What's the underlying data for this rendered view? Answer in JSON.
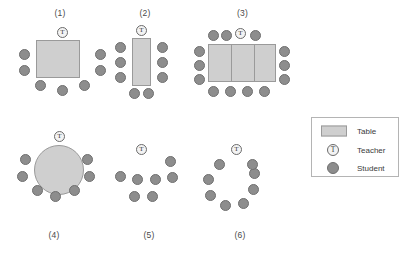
{
  "diagram": {
    "background_color": "#ffffff",
    "colors": {
      "table_fill": "#cfcfcf",
      "table_stroke": "#9a9a9a",
      "student_fill": "#8d8d8d",
      "student_stroke": "#6f6f6f",
      "teacher_fill": "#f3f3f3",
      "teacher_stroke": "#6b6b6b",
      "label_text": "#3a3a3a",
      "legend_border": "#b4b4b4"
    },
    "teacher_glyph": "T"
  },
  "arrangements": [
    {
      "id": "arrangement-1",
      "label": "(1)",
      "label_position": "top",
      "table": {
        "shape": "square",
        "count": 1,
        "segments": 1
      },
      "teacher_count": 1,
      "student_count": 7,
      "teacher": {
        "x": 47,
        "y": 5
      },
      "students": [
        {
          "x": 9,
          "y": 27
        },
        {
          "x": 9,
          "y": 43
        },
        {
          "x": 85,
          "y": 27
        },
        {
          "x": 85,
          "y": 43
        },
        {
          "x": 25,
          "y": 58
        },
        {
          "x": 47,
          "y": 63
        },
        {
          "x": 69,
          "y": 58
        }
      ]
    },
    {
      "id": "arrangement-2",
      "label": "(2)",
      "label_position": "top",
      "table": {
        "shape": "rectangle-vertical",
        "count": 1,
        "segments": 1
      },
      "teacher_count": 1,
      "student_count": 8,
      "teacher": {
        "x": 34,
        "y": 5
      },
      "students": [
        {
          "x": 10,
          "y": 24
        },
        {
          "x": 10,
          "y": 39
        },
        {
          "x": 10,
          "y": 54
        },
        {
          "x": 58,
          "y": 24
        },
        {
          "x": 58,
          "y": 39
        },
        {
          "x": 58,
          "y": 54
        },
        {
          "x": 27,
          "y": 68
        },
        {
          "x": 41,
          "y": 68
        }
      ]
    },
    {
      "id": "arrangement-3",
      "label": "(3)",
      "label_position": "top",
      "table": {
        "shape": "rectangle-joined",
        "count": 3,
        "segments": 3
      },
      "teacher_count": 1,
      "student_count": 13,
      "teacher": {
        "x": 45,
        "y": 6
      },
      "students": [
        {
          "x": 18,
          "y": 8
        },
        {
          "x": 31,
          "y": 8
        },
        {
          "x": 58,
          "y": 8
        },
        {
          "x": 3,
          "y": 25
        },
        {
          "x": 3,
          "y": 40
        },
        {
          "x": 3,
          "y": 55
        },
        {
          "x": 74,
          "y": 25
        },
        {
          "x": 74,
          "y": 40
        },
        {
          "x": 74,
          "y": 55
        },
        {
          "x": 16,
          "y": 70
        },
        {
          "x": 32,
          "y": 70
        },
        {
          "x": 48,
          "y": 70
        },
        {
          "x": 64,
          "y": 70
        }
      ]
    },
    {
      "id": "arrangement-4",
      "label": "(4)",
      "label_position": "bottom",
      "table": {
        "shape": "round",
        "count": 1,
        "segments": 1
      },
      "teacher_count": 1,
      "student_count": 7,
      "teacher": {
        "x": 42,
        "y": 2
      },
      "students": [
        {
          "x": 8,
          "y": 26
        },
        {
          "x": 5,
          "y": 43
        },
        {
          "x": 20,
          "y": 57
        },
        {
          "x": 38,
          "y": 63
        },
        {
          "x": 57,
          "y": 57
        },
        {
          "x": 72,
          "y": 43
        },
        {
          "x": 70,
          "y": 26
        }
      ]
    },
    {
      "id": "arrangement-5",
      "label": "(5)",
      "label_position": "bottom",
      "table": null,
      "teacher_count": 1,
      "student_count": 7,
      "teacher": {
        "x": 26,
        "y": 2
      },
      "students": [
        {
          "x": 55,
          "y": 16
        },
        {
          "x": 5,
          "y": 31
        },
        {
          "x": 22,
          "y": 34
        },
        {
          "x": 40,
          "y": 34
        },
        {
          "x": 57,
          "y": 32
        },
        {
          "x": 19,
          "y": 51
        },
        {
          "x": 37,
          "y": 51
        }
      ]
    },
    {
      "id": "arrangement-6",
      "label": "(6)",
      "label_position": "bottom",
      "table": null,
      "teacher_count": 1,
      "student_count": 8,
      "teacher": {
        "x": 31,
        "y": 2
      },
      "students": [
        {
          "x": 14,
          "y": 17
        },
        {
          "x": 3,
          "y": 33
        },
        {
          "x": 4,
          "y": 50
        },
        {
          "x": 19,
          "y": 61
        },
        {
          "x": 38,
          "y": 60
        },
        {
          "x": 50,
          "y": 46
        },
        {
          "x": 50,
          "y": 28
        },
        {
          "x": 48,
          "y": 20
        }
      ]
    }
  ],
  "legend": {
    "title": "Legend",
    "items": [
      {
        "symbol": "table-swatch",
        "label": "Table"
      },
      {
        "symbol": "teacher-swatch",
        "label": "Teacher",
        "glyph": "T"
      },
      {
        "symbol": "student-swatch",
        "label": "Student"
      }
    ]
  }
}
